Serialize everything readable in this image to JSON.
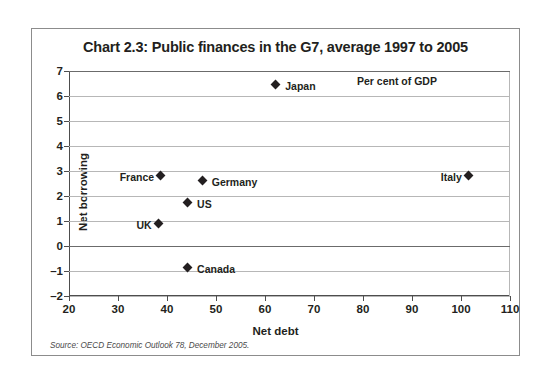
{
  "chart_data": {
    "type": "scatter",
    "title": "Chart 2.3: Public finances in the G7, average 1997 to 2005",
    "xlabel": "Net debt",
    "ylabel": "Net borrowing",
    "units_note": "Per cent of GDP",
    "source": "Source: OECD Economic Outlook 78, December 2005.",
    "xlim": [
      20,
      110
    ],
    "ylim": [
      -2,
      7
    ],
    "xticks": [
      "20",
      "30",
      "40",
      "50",
      "60",
      "70",
      "80",
      "90",
      "100",
      "110"
    ],
    "xtick_values": [
      20,
      30,
      40,
      50,
      60,
      70,
      80,
      90,
      100,
      110
    ],
    "yticks": [
      "7",
      "6",
      "5",
      "4",
      "3",
      "2",
      "1",
      "0",
      "–1",
      "–2"
    ],
    "ytick_values": [
      7,
      6,
      5,
      4,
      3,
      2,
      1,
      0,
      -1,
      -2
    ],
    "grid": "horizontal",
    "legend": "none",
    "points": [
      {
        "label": "Japan",
        "x": 62.5,
        "y": 6.4,
        "label_side": "right"
      },
      {
        "label": "Italy",
        "x": 101.8,
        "y": 2.75,
        "label_side": "left"
      },
      {
        "label": "France",
        "x": 39.0,
        "y": 2.75,
        "label_side": "left"
      },
      {
        "label": "Germany",
        "x": 47.5,
        "y": 2.55,
        "label_side": "right"
      },
      {
        "label": "US",
        "x": 44.5,
        "y": 1.7,
        "label_side": "right"
      },
      {
        "label": "UK",
        "x": 38.5,
        "y": 0.85,
        "label_side": "left"
      },
      {
        "label": "Canada",
        "x": 44.5,
        "y": -0.9,
        "label_side": "right"
      }
    ]
  }
}
